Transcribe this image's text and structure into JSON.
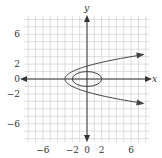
{
  "chart_data": {
    "type": "line",
    "title": "",
    "xlabel": "x",
    "ylabel": "y",
    "xlim": [
      -8.5,
      8.5
    ],
    "ylim": [
      -8.5,
      8.5
    ],
    "grid": true,
    "grid_step": 1,
    "x_ticks": [
      -6,
      -2,
      0,
      2,
      6
    ],
    "y_ticks": [
      6,
      2,
      0,
      -2,
      -6
    ],
    "x_tick_labels": [
      "−6",
      "−2",
      "0",
      "2",
      "6"
    ],
    "y_tick_labels": [
      "6",
      "2",
      "0",
      "−2",
      "−6"
    ],
    "series": [
      {
        "name": "parabola",
        "equation": "x = y^2 - 3",
        "shape": "parabola opening right",
        "vertex": [
          -3,
          0
        ],
        "arrows": true,
        "points": [
          [
            8,
            3.3
          ],
          [
            6,
            3
          ],
          [
            1,
            2
          ],
          [
            -2,
            1
          ],
          [
            -3,
            0
          ],
          [
            -2,
            -1
          ],
          [
            1,
            -2
          ],
          [
            6,
            -3
          ],
          [
            8,
            -3.3
          ]
        ]
      },
      {
        "name": "ellipse",
        "equation": "x^2/4 + y^2 = 1",
        "shape": "ellipse",
        "center": [
          0,
          0
        ],
        "semi_axes": [
          2,
          1
        ]
      }
    ],
    "legend": null
  },
  "colors": {
    "curve": "#444444",
    "axis": "#333333",
    "grid": "#c8c8c8"
  }
}
